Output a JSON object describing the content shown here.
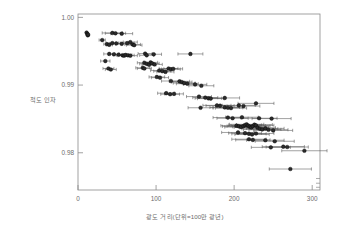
{
  "chart_data": {
    "type": "scatter",
    "title": "",
    "xlabel": "광도 거리(단위=100만 광년)",
    "ylabel": "척도 인자",
    "xlim": [
      0,
      310
    ],
    "ylim": [
      0.9745,
      1.0005
    ],
    "xticks": [
      0,
      100,
      200,
      300
    ],
    "xticklabels": [
      "0",
      "100",
      "200",
      "300"
    ],
    "yticks": [
      0.98,
      0.99,
      1.0
    ],
    "yticklabels": [
      "0.98",
      "0.99",
      "1.00"
    ],
    "grid": false,
    "legend": null,
    "marker": "circle",
    "marker_color": "#2b2b2b",
    "errorbar_color": "#555555",
    "errorbar_orientation": "horizontal",
    "frame_color": "#8a8a8a",
    "background": "#ffffff",
    "points": [
      {
        "x": 11,
        "y": 0.99775,
        "xerr": 2
      },
      {
        "x": 12,
        "y": 0.99755,
        "xerr": 2
      },
      {
        "x": 12.5,
        "y": 0.99735,
        "xerr": 2
      },
      {
        "x": 13,
        "y": 0.99745,
        "xerr": 2
      },
      {
        "x": 31,
        "y": 0.99665,
        "xerr": 4
      },
      {
        "x": 37,
        "y": 0.99605,
        "xerr": 4
      },
      {
        "x": 40,
        "y": 0.99595,
        "xerr": 4
      },
      {
        "x": 44,
        "y": 0.9977,
        "xerr": 13
      },
      {
        "x": 48,
        "y": 0.99765,
        "xerr": 13
      },
      {
        "x": 56,
        "y": 0.9976,
        "xerr": 14
      },
      {
        "x": 44,
        "y": 0.9962,
        "xerr": 8
      },
      {
        "x": 49,
        "y": 0.99615,
        "xerr": 8
      },
      {
        "x": 56,
        "y": 0.9961,
        "xerr": 8
      },
      {
        "x": 63,
        "y": 0.9962,
        "xerr": 9
      },
      {
        "x": 67,
        "y": 0.99635,
        "xerr": 9
      },
      {
        "x": 70,
        "y": 0.996,
        "xerr": 10
      },
      {
        "x": 72,
        "y": 0.9959,
        "xerr": 10
      },
      {
        "x": 40,
        "y": 0.9946,
        "xerr": 7
      },
      {
        "x": 46,
        "y": 0.99455,
        "xerr": 7
      },
      {
        "x": 52,
        "y": 0.9945,
        "xerr": 7
      },
      {
        "x": 57,
        "y": 0.9944,
        "xerr": 8
      },
      {
        "x": 59,
        "y": 0.99435,
        "xerr": 8
      },
      {
        "x": 61,
        "y": 0.99445,
        "xerr": 8
      },
      {
        "x": 64,
        "y": 0.9944,
        "xerr": 8
      },
      {
        "x": 67,
        "y": 0.99435,
        "xerr": 9
      },
      {
        "x": 35,
        "y": 0.99355,
        "xerr": 6
      },
      {
        "x": 39,
        "y": 0.99245,
        "xerr": 7
      },
      {
        "x": 42,
        "y": 0.9923,
        "xerr": 7
      },
      {
        "x": 86,
        "y": 0.99465,
        "xerr": 9
      },
      {
        "x": 88,
        "y": 0.9944,
        "xerr": 9
      },
      {
        "x": 97,
        "y": 0.99455,
        "xerr": 10
      },
      {
        "x": 85,
        "y": 0.9933,
        "xerr": 9
      },
      {
        "x": 88,
        "y": 0.99315,
        "xerr": 9
      },
      {
        "x": 91,
        "y": 0.993,
        "xerr": 9
      },
      {
        "x": 93,
        "y": 0.99335,
        "xerr": 9
      },
      {
        "x": 95,
        "y": 0.9932,
        "xerr": 9
      },
      {
        "x": 98,
        "y": 0.99305,
        "xerr": 10
      },
      {
        "x": 83,
        "y": 0.99255,
        "xerr": 9
      },
      {
        "x": 85,
        "y": 0.99245,
        "xerr": 9
      },
      {
        "x": 104,
        "y": 0.99215,
        "xerr": 11
      },
      {
        "x": 108,
        "y": 0.99205,
        "xerr": 11
      },
      {
        "x": 112,
        "y": 0.99195,
        "xerr": 11
      },
      {
        "x": 116,
        "y": 0.99245,
        "xerr": 12
      },
      {
        "x": 119,
        "y": 0.99235,
        "xerr": 12
      },
      {
        "x": 122,
        "y": 0.9924,
        "xerr": 12
      },
      {
        "x": 144,
        "y": 0.9946,
        "xerr": 16
      },
      {
        "x": 101,
        "y": 0.9912,
        "xerr": 10
      },
      {
        "x": 105,
        "y": 0.9911,
        "xerr": 11
      },
      {
        "x": 119,
        "y": 0.9906,
        "xerr": 12
      },
      {
        "x": 130,
        "y": 0.99055,
        "xerr": 13
      },
      {
        "x": 133,
        "y": 0.99045,
        "xerr": 13
      },
      {
        "x": 136,
        "y": 0.9903,
        "xerr": 14
      },
      {
        "x": 140,
        "y": 0.9902,
        "xerr": 14
      },
      {
        "x": 150,
        "y": 0.9901,
        "xerr": 15
      },
      {
        "x": 158,
        "y": 0.9899,
        "xerr": 16
      },
      {
        "x": 113,
        "y": 0.9888,
        "xerr": 11
      },
      {
        "x": 118,
        "y": 0.98865,
        "xerr": 12
      },
      {
        "x": 123,
        "y": 0.9887,
        "xerr": 12
      },
      {
        "x": 155,
        "y": 0.9883,
        "xerr": 16
      },
      {
        "x": 163,
        "y": 0.98815,
        "xerr": 16
      },
      {
        "x": 167,
        "y": 0.98805,
        "xerr": 17
      },
      {
        "x": 170,
        "y": 0.988,
        "xerr": 17
      },
      {
        "x": 188,
        "y": 0.9881,
        "xerr": 19
      },
      {
        "x": 157,
        "y": 0.98665,
        "xerr": 16
      },
      {
        "x": 178,
        "y": 0.987,
        "xerr": 18
      },
      {
        "x": 182,
        "y": 0.98695,
        "xerr": 18
      },
      {
        "x": 188,
        "y": 0.9867,
        "xerr": 19
      },
      {
        "x": 192,
        "y": 0.98665,
        "xerr": 19
      },
      {
        "x": 196,
        "y": 0.9866,
        "xerr": 20
      },
      {
        "x": 206,
        "y": 0.987,
        "xerr": 21
      },
      {
        "x": 212,
        "y": 0.9869,
        "xerr": 21
      },
      {
        "x": 228,
        "y": 0.9873,
        "xerr": 23
      },
      {
        "x": 192,
        "y": 0.9852,
        "xerr": 19
      },
      {
        "x": 198,
        "y": 0.9851,
        "xerr": 20
      },
      {
        "x": 210,
        "y": 0.98525,
        "xerr": 21
      },
      {
        "x": 232,
        "y": 0.9851,
        "xerr": 23
      },
      {
        "x": 248,
        "y": 0.98505,
        "xerr": 25
      },
      {
        "x": 203,
        "y": 0.984,
        "xerr": 20
      },
      {
        "x": 206,
        "y": 0.9839,
        "xerr": 21
      },
      {
        "x": 209,
        "y": 0.9838,
        "xerr": 21
      },
      {
        "x": 212,
        "y": 0.98395,
        "xerr": 21
      },
      {
        "x": 214,
        "y": 0.9841,
        "xerr": 21
      },
      {
        "x": 216,
        "y": 0.9842,
        "xerr": 22
      },
      {
        "x": 218,
        "y": 0.984,
        "xerr": 22
      },
      {
        "x": 220,
        "y": 0.98385,
        "xerr": 22
      },
      {
        "x": 222,
        "y": 0.98375,
        "xerr": 22
      },
      {
        "x": 224,
        "y": 0.98395,
        "xerr": 22
      },
      {
        "x": 226,
        "y": 0.98415,
        "xerr": 23
      },
      {
        "x": 228,
        "y": 0.98405,
        "xerr": 23
      },
      {
        "x": 230,
        "y": 0.9837,
        "xerr": 23
      },
      {
        "x": 233,
        "y": 0.98355,
        "xerr": 23
      },
      {
        "x": 236,
        "y": 0.98345,
        "xerr": 24
      },
      {
        "x": 240,
        "y": 0.9836,
        "xerr": 24
      },
      {
        "x": 244,
        "y": 0.9834,
        "xerr": 25
      },
      {
        "x": 250,
        "y": 0.9833,
        "xerr": 25
      },
      {
        "x": 205,
        "y": 0.983,
        "xerr": 21
      },
      {
        "x": 214,
        "y": 0.9829,
        "xerr": 21
      },
      {
        "x": 219,
        "y": 0.9828,
        "xerr": 22
      },
      {
        "x": 223,
        "y": 0.9827,
        "xerr": 22
      },
      {
        "x": 228,
        "y": 0.98285,
        "xerr": 23
      },
      {
        "x": 219,
        "y": 0.982,
        "xerr": 22
      },
      {
        "x": 224,
        "y": 0.9819,
        "xerr": 22
      },
      {
        "x": 240,
        "y": 0.98185,
        "xerr": 24
      },
      {
        "x": 252,
        "y": 0.9817,
        "xerr": 25
      },
      {
        "x": 247,
        "y": 0.9808,
        "xerr": 25
      },
      {
        "x": 263,
        "y": 0.9809,
        "xerr": 27
      },
      {
        "x": 268,
        "y": 0.98085,
        "xerr": 27
      },
      {
        "x": 290,
        "y": 0.9803,
        "xerr": 29
      },
      {
        "x": 272,
        "y": 0.9776,
        "xerr": 27
      }
    ]
  }
}
